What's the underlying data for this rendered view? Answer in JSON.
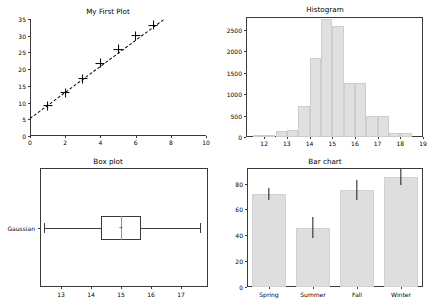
{
  "figure": {
    "width": 433,
    "height": 308,
    "background": "#ffffff",
    "axis_color": "#3a3a3a",
    "bar_fill": "#dedede",
    "hist_fill": "#e0e0e0"
  },
  "chart_data": [
    {
      "type": "scatter",
      "title": "My First Plot",
      "xlabel": "",
      "ylabel": "",
      "xlim": [
        0,
        10
      ],
      "ylim": [
        0,
        35
      ],
      "xticks": [
        0,
        2,
        4,
        6,
        8,
        10
      ],
      "yticks": [
        0,
        5,
        10,
        15,
        20,
        25,
        30,
        35
      ],
      "grid": false,
      "legend": null,
      "marker": "plus",
      "x": [
        1,
        2,
        3,
        4,
        5,
        6,
        7
      ],
      "y": [
        9.0,
        13.0,
        17.2,
        21.7,
        26.0,
        30.0,
        33.2
      ],
      "fit_line": {
        "style": "dashed",
        "x": [
          0,
          7.6
        ],
        "y": [
          5.4,
          35.0
        ]
      }
    },
    {
      "type": "bar",
      "subtype": "histogram",
      "title": "Histogram",
      "xlabel": "",
      "ylabel": "",
      "xlim": [
        11.2,
        19.0
      ],
      "ylim": [
        0,
        2800
      ],
      "xticks": [
        12,
        13,
        14,
        15,
        16,
        17,
        18,
        19
      ],
      "yticks": [
        0,
        500,
        1000,
        1500,
        2000,
        2500
      ],
      "grid": false,
      "bin_edges": [
        11.5,
        12.0,
        12.5,
        13.0,
        13.5,
        14.0,
        14.5,
        15.0,
        15.5,
        16.0,
        16.5,
        17.0,
        17.5,
        18.0,
        18.5
      ],
      "categories": [
        "11.5-12.0",
        "12.0-12.5",
        "12.5-13.0",
        "13.0-13.5",
        "13.5-14.0",
        "14.0-14.5",
        "14.5-15.0",
        "15.0-15.5",
        "15.5-16.0",
        "16.0-16.5",
        "16.5-17.0",
        "17.0-17.5",
        "17.5-18.0",
        "18.0-18.5"
      ],
      "values": [
        20,
        40,
        150,
        160,
        720,
        1840,
        2760,
        2590,
        1270,
        1250,
        500,
        500,
        100,
        100
      ]
    },
    {
      "type": "box",
      "title": "Box plot",
      "orientation": "horizontal",
      "xlim": [
        12.3,
        17.9
      ],
      "xticks": [
        13,
        14,
        15,
        16,
        17
      ],
      "yticks": [
        "Gaussian"
      ],
      "grid": false,
      "categories": [
        "Gaussian"
      ],
      "boxes": [
        {
          "label": "Gaussian",
          "whisker_low": 12.42,
          "q1": 14.33,
          "median": 15.0,
          "mean": 15.0,
          "q3": 15.67,
          "whisker_high": 17.62
        }
      ]
    },
    {
      "type": "bar",
      "title": "Bar chart",
      "xlabel": "",
      "ylabel": "",
      "ylim": [
        0,
        92
      ],
      "yticks": [
        0,
        20,
        40,
        60,
        80
      ],
      "grid": false,
      "categories": [
        "Spring",
        "Summer",
        "Fall",
        "Winter"
      ],
      "values": [
        72,
        46,
        75,
        85
      ],
      "errors": [
        4.5,
        8.5,
        7.5,
        6.0
      ]
    }
  ],
  "panels": {
    "scatter": {
      "title": "My First Plot"
    },
    "histogram": {
      "title": "Histogram"
    },
    "boxplot": {
      "title": "Box plot",
      "category_label": "Gaussian"
    },
    "barchart": {
      "title": "Bar chart"
    }
  }
}
